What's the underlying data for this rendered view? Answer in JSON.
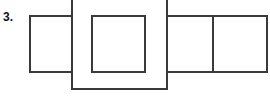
{
  "figure": {
    "label": "3.",
    "kind": "net-of-a-solid-diagram",
    "background_color": "#ffffff",
    "stroke_color": "#3a3a3a",
    "stroke_width": 2,
    "canvas": {
      "width": 270,
      "height": 99
    }
  },
  "shapes": [
    {
      "name": "left-face-rectangle",
      "role": "left side face",
      "x": 30,
      "y": 16,
      "width": 42,
      "height": 56,
      "fill": "#ffffff",
      "stroke": "#3a3a3a"
    },
    {
      "name": "center-large-rectangle",
      "role": "front face (extends above and below, clipped at top)",
      "x": 72,
      "y": -10,
      "width": 95,
      "height": 99,
      "fill": "#ffffff",
      "stroke": "#3a3a3a"
    },
    {
      "name": "inner-rectangle",
      "role": "inner square drawn inside the front face",
      "x": 92,
      "y": 16,
      "width": 53,
      "height": 56,
      "fill": "#ffffff",
      "stroke": "#3a3a3a"
    },
    {
      "name": "right-face-rectangle-1",
      "role": "right side face (first)",
      "x": 167,
      "y": 16,
      "width": 46,
      "height": 56,
      "fill": "#ffffff",
      "stroke": "#3a3a3a"
    },
    {
      "name": "right-face-rectangle-2",
      "role": "right side face (second, clipped at right edge)",
      "x": 213,
      "y": 16,
      "width": 54,
      "height": 56,
      "fill": "#ffffff",
      "stroke": "#3a3a3a"
    }
  ]
}
